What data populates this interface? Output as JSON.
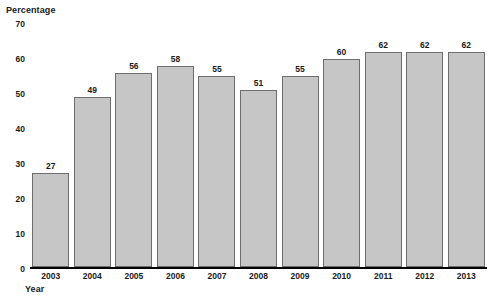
{
  "chart_data": {
    "type": "bar",
    "title": "",
    "subtitle": "",
    "xlabel": "Year",
    "ylabel": "Percentage",
    "categories": [
      "2003",
      "2004",
      "2005",
      "2006",
      "2007",
      "2008",
      "2009",
      "2010",
      "2011",
      "2012",
      "2013"
    ],
    "values": [
      27,
      49,
      56,
      58,
      55,
      51,
      55,
      60,
      62,
      62,
      62
    ],
    "data_labels": [
      "27",
      "49",
      "56",
      "58",
      "55",
      "51",
      "55",
      "60",
      "62",
      "62",
      "62"
    ],
    "ylim": [
      0,
      70
    ],
    "ytick_values": [
      0,
      10,
      20,
      30,
      40,
      50,
      60,
      70
    ],
    "ytick_labels": [
      "0",
      "10",
      "20",
      "30",
      "40",
      "50",
      "60",
      "70"
    ],
    "grid": false,
    "legend": false,
    "legend_position": "none",
    "bar_fill_color": "#c6c6c6",
    "bar_border_color": "#6e6e6e",
    "axis_color": "#000000",
    "text_color": "#1a1a1a",
    "background_color": "#ffffff"
  }
}
